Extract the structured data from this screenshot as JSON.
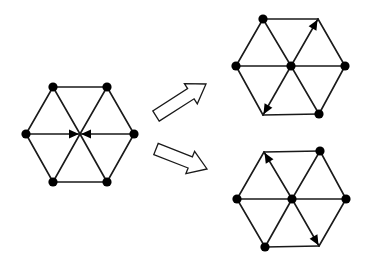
{
  "colors": {
    "stroke": "#1a1a1a",
    "node": "#000000",
    "background": "#ffffff",
    "arrow_fill": "#ffffff"
  },
  "diagram": {
    "graphs": [
      {
        "id": "initial",
        "vertices": {
          "tl": [
            53,
            87
          ],
          "tr": [
            107,
            87
          ],
          "l": [
            26,
            134
          ],
          "c": [
            80,
            134
          ],
          "r": [
            134,
            134
          ],
          "bl": [
            53,
            182
          ],
          "br": [
            107,
            182
          ]
        },
        "dots": [
          "tl",
          "tr",
          "l",
          "r",
          "bl",
          "br"
        ],
        "edges": [
          [
            "tl",
            "tr"
          ],
          [
            "tr",
            "r"
          ],
          [
            "r",
            "br"
          ],
          [
            "br",
            "bl"
          ],
          [
            "bl",
            "l"
          ],
          [
            "l",
            "tl"
          ],
          [
            "tl",
            "c"
          ],
          [
            "tr",
            "c"
          ],
          [
            "bl",
            "c"
          ],
          [
            "br",
            "c"
          ],
          [
            "l",
            "c"
          ],
          [
            "r",
            "c"
          ]
        ],
        "arrows": [
          [
            "l",
            "c"
          ],
          [
            "r",
            "c"
          ]
        ]
      },
      {
        "id": "result-top",
        "vertices": {
          "tl": [
            263,
            19
          ],
          "tr": [
            318,
            19
          ],
          "l": [
            236,
            66
          ],
          "c": [
            291,
            66
          ],
          "r": [
            345,
            66
          ],
          "bl": [
            263,
            115
          ],
          "br": [
            319,
            114
          ]
        },
        "dots": [
          "tl",
          "l",
          "c",
          "r",
          "br"
        ],
        "edges": [
          [
            "tl",
            "tr"
          ],
          [
            "tr",
            "r"
          ],
          [
            "r",
            "br"
          ],
          [
            "br",
            "bl"
          ],
          [
            "bl",
            "l"
          ],
          [
            "l",
            "tl"
          ],
          [
            "tl",
            "c"
          ],
          [
            "tr",
            "c"
          ],
          [
            "bl",
            "c"
          ],
          [
            "br",
            "c"
          ],
          [
            "l",
            "c"
          ],
          [
            "r",
            "c"
          ]
        ],
        "arrows": [
          [
            "c",
            "tr"
          ],
          [
            "c",
            "bl"
          ]
        ]
      },
      {
        "id": "result-bottom",
        "vertices": {
          "tl": [
            264,
            152
          ],
          "tr": [
            320,
            151
          ],
          "l": [
            237,
            199
          ],
          "c": [
            292,
            199
          ],
          "r": [
            346,
            199
          ],
          "bl": [
            265,
            247
          ],
          "br": [
            319,
            246
          ]
        },
        "dots": [
          "tr",
          "l",
          "c",
          "r",
          "bl"
        ],
        "edges": [
          [
            "tl",
            "tr"
          ],
          [
            "tr",
            "r"
          ],
          [
            "r",
            "br"
          ],
          [
            "br",
            "bl"
          ],
          [
            "bl",
            "l"
          ],
          [
            "l",
            "tl"
          ],
          [
            "tl",
            "c"
          ],
          [
            "tr",
            "c"
          ],
          [
            "bl",
            "c"
          ],
          [
            "br",
            "c"
          ],
          [
            "l",
            "c"
          ],
          [
            "r",
            "c"
          ]
        ],
        "arrows": [
          [
            "c",
            "tl"
          ],
          [
            "c",
            "br"
          ]
        ]
      }
    ],
    "transition_arrows": [
      {
        "id": "to-top",
        "from": [
          156,
          116
        ],
        "to": [
          206,
          84
        ]
      },
      {
        "id": "to-bottom",
        "from": [
          156,
          149
        ],
        "to": [
          207,
          169
        ]
      }
    ]
  }
}
